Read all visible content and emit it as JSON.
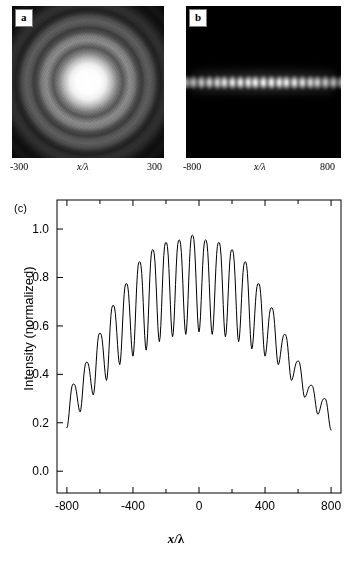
{
  "figure": {
    "panels": [
      {
        "tag": "a",
        "kind": "image",
        "description": "concentric-diffraction-rings",
        "axis_left_label": "-300",
        "axis_center_label": "x/λ",
        "axis_right_label": "300"
      },
      {
        "tag": "b",
        "kind": "image",
        "description": "horizontal-fringe-row",
        "axis_left_label": "-800",
        "axis_center_label": "x/λ",
        "axis_right_label": "800",
        "fringe_count": 21
      },
      {
        "tag": "(c)",
        "kind": "plot"
      }
    ]
  },
  "chart_data": {
    "type": "line",
    "title": "",
    "xlabel": "x/λ",
    "ylabel": "Intensity (normalized)",
    "xlim": [
      -860,
      860
    ],
    "ylim": [
      -0.09,
      1.12
    ],
    "xticks": [
      -800,
      -400,
      0,
      400,
      800
    ],
    "xticklabels": [
      "-800",
      "-400",
      "0",
      "400",
      "800"
    ],
    "xminorticks": [
      -600,
      -200,
      200,
      600
    ],
    "yticks": [
      0.0,
      0.2,
      0.4,
      0.6,
      0.8,
      1.0
    ],
    "yticklabels": [
      "0.0",
      "0.2",
      "0.4",
      "0.6",
      "0.8",
      "1.0"
    ],
    "grid": false,
    "legend": null,
    "line_color": "#000000",
    "line_width": 1,
    "envelope_peak": 0.98,
    "fringe_period": 80,
    "series": [
      {
        "name": "intensity",
        "peaks_x": [
          -760,
          -680,
          -600,
          -520,
          -440,
          -360,
          -280,
          -200,
          -120,
          -40,
          40,
          120,
          200,
          280,
          360,
          440,
          520,
          600,
          680,
          760
        ],
        "peaks_y": [
          0.36,
          0.45,
          0.57,
          0.685,
          0.775,
          0.865,
          0.915,
          0.945,
          0.955,
          0.975,
          0.955,
          0.945,
          0.915,
          0.865,
          0.775,
          0.675,
          0.565,
          0.455,
          0.355,
          0.3
        ],
        "troughs_x": [
          -800,
          -720,
          -640,
          -560,
          -480,
          -400,
          -320,
          -240,
          -160,
          -80,
          0,
          80,
          160,
          240,
          320,
          400,
          480,
          560,
          640,
          720,
          800
        ],
        "troughs_y": [
          0.18,
          0.245,
          0.315,
          0.375,
          0.44,
          0.475,
          0.5,
          0.535,
          0.555,
          0.565,
          0.575,
          0.565,
          0.555,
          0.535,
          0.505,
          0.475,
          0.44,
          0.375,
          0.305,
          0.235,
          0.17
        ]
      }
    ]
  }
}
